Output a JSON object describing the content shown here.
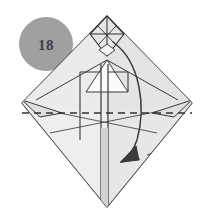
{
  "figure": {
    "type": "origami-instruction-diagram",
    "step_badge": {
      "label": "18",
      "shape": "circle",
      "fill_color": "#a0a0a0",
      "text_color": "#3f3f3f",
      "center_x": 46,
      "center_y": 44,
      "radius": 27
    },
    "canvas": {
      "width": 207,
      "height": 218,
      "background_color": "#ffffff"
    },
    "paper": {
      "fill_front": "#e8e8e6",
      "fill_back": "#dcdcda",
      "fill_highlight": "#f2f2f0",
      "stroke_color": "#3a3a3a",
      "stroke_width": 1.1,
      "outline_description": "large diamond / kite shape with pointed top and bottom",
      "outline_points": "107,16 192,103 107,207 22,103"
    },
    "fold_line": {
      "style": "dashed",
      "meaning": "valley-fold",
      "color": "#2f2f2f",
      "dash_pattern": "7 5",
      "x1": 22,
      "y1": 113,
      "x2": 192,
      "y2": 113
    },
    "arrow": {
      "type": "curved-fold-arrow",
      "direction": "down-left",
      "color": "#3a3a3a",
      "start_x": 113,
      "start_y": 42,
      "end_x": 120,
      "end_y": 162,
      "head_size": 13
    },
    "top_detail": {
      "name": "small-diamond-tip",
      "description": "narrow diamond with internal crease lines at the top point"
    },
    "center_detail": {
      "name": "center-vertical-strip",
      "description": "narrow vertical strip running from middle to bottom point"
    },
    "side_flaps": {
      "left": "small triangular flap on left corner",
      "right": "small triangular flap on right corner"
    }
  }
}
